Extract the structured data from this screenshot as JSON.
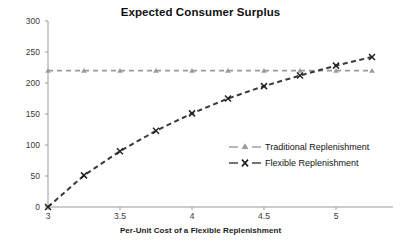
{
  "chart_data": {
    "type": "line",
    "title": "Expected Consumer Surplus",
    "xlabel": "Per-Unit Cost of a Flexible Replenishment",
    "ylabel": "",
    "xlim": [
      3,
      5.25
    ],
    "ylim": [
      0,
      300
    ],
    "grid": false,
    "legend_position": "center-right",
    "xticks": [
      "3",
      "3.5",
      "4",
      "4.5",
      "5"
    ],
    "xtick_values": [
      3,
      3.5,
      4,
      4.5,
      5
    ],
    "yticks": [
      "0",
      "50",
      "100",
      "150",
      "200",
      "250",
      "300"
    ],
    "ytick_values": [
      0,
      50,
      100,
      150,
      200,
      250,
      300
    ],
    "x": [
      3,
      3.25,
      3.5,
      3.75,
      4,
      4.25,
      4.5,
      4.75,
      5,
      5.25
    ],
    "series": [
      {
        "name": "Traditional Replenishment",
        "marker": "triangle",
        "color": "#9a9a9a",
        "dash": "dashed",
        "values": [
          220,
          220,
          220,
          220,
          220,
          220,
          220,
          220,
          220,
          220
        ]
      },
      {
        "name": "Flexible Replenishment",
        "marker": "x",
        "color": "#3a3a3a",
        "dash": "dashed",
        "values": [
          0,
          51,
          90,
          123,
          151,
          175,
          195,
          212,
          228,
          242
        ]
      }
    ]
  },
  "axes": {
    "axis_color": "#9b9b9b",
    "tick_color": "#9b9b9b"
  }
}
